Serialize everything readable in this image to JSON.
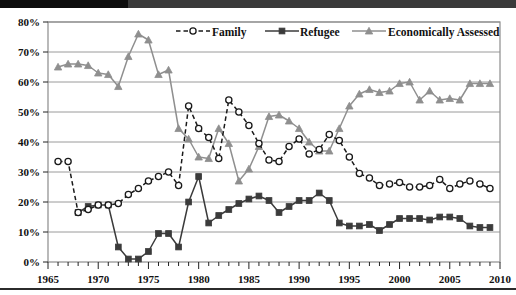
{
  "chart_data": {
    "type": "line",
    "title": "",
    "xlabel": "",
    "ylabel": "",
    "xlim": [
      1965,
      2010
    ],
    "ylim": [
      0,
      80
    ],
    "y_tick_labels": [
      "0%",
      "10%",
      "20%",
      "30%",
      "40%",
      "50%",
      "60%",
      "70%",
      "80%"
    ],
    "y_ticks": [
      0,
      10,
      20,
      30,
      40,
      50,
      60,
      70,
      80
    ],
    "x_tick_labels": [
      "1965",
      "1970",
      "1975",
      "1980",
      "1985",
      "1990",
      "1995",
      "2000",
      "2005",
      "2010"
    ],
    "x_ticks": [
      1965,
      1970,
      1975,
      1980,
      1985,
      1990,
      1995,
      2000,
      2005,
      2010
    ],
    "x_minor_tick_interval": 1,
    "grid": true,
    "grid_axis": "y",
    "legend_position": "top-center-inside",
    "series": [
      {
        "name": "Family",
        "marker": "open-circle",
        "line_style": "dashed",
        "color": "#1a1a1a",
        "x": [
          1966,
          1967,
          1968,
          1969,
          1970,
          1971,
          1972,
          1973,
          1974,
          1975,
          1976,
          1977,
          1978,
          1979,
          1980,
          1981,
          1982,
          1983,
          1984,
          1985,
          1986,
          1987,
          1988,
          1989,
          1990,
          1991,
          1992,
          1993,
          1994,
          1995,
          1996,
          1997,
          1998,
          1999,
          2000,
          2001,
          2002,
          2003,
          2004,
          2005,
          2006,
          2007,
          2008,
          2009
        ],
        "y": [
          33.5,
          33.5,
          16.5,
          17.5,
          19.0,
          19.0,
          19.5,
          22.5,
          24.5,
          27.0,
          28.5,
          30.0,
          25.5,
          52.0,
          44.5,
          41.5,
          34.5,
          54.0,
          50.0,
          45.5,
          39.5,
          34.0,
          33.5,
          38.5,
          41.0,
          36.0,
          37.5,
          42.5,
          40.5,
          35.0,
          29.5,
          28.0,
          25.5,
          26.0,
          26.5,
          25.0,
          25.0,
          25.5,
          27.5,
          24.5,
          26.0,
          27.0,
          26.0,
          24.5
        ]
      },
      {
        "name": "Refugee",
        "marker": "filled-square",
        "line_style": "solid",
        "color": "#3b3b3b",
        "x": [
          1968,
          1969,
          1970,
          1971,
          1972,
          1973,
          1974,
          1975,
          1976,
          1977,
          1978,
          1979,
          1980,
          1981,
          1982,
          1983,
          1984,
          1985,
          1986,
          1987,
          1988,
          1989,
          1990,
          1991,
          1992,
          1993,
          1994,
          1995,
          1996,
          1997,
          1998,
          1999,
          2000,
          2001,
          2002,
          2003,
          2004,
          2005,
          2006,
          2007,
          2008,
          2009
        ],
        "y": [
          16.5,
          18.5,
          19.0,
          19.0,
          5.0,
          1.0,
          1.0,
          3.5,
          9.5,
          9.5,
          5.0,
          20.0,
          28.5,
          13.0,
          15.5,
          17.5,
          19.5,
          21.0,
          22.0,
          20.5,
          16.5,
          18.5,
          20.5,
          20.5,
          23.0,
          20.5,
          13.0,
          12.0,
          12.0,
          12.5,
          10.5,
          12.5,
          14.5,
          14.5,
          14.5,
          14.0,
          15.0,
          15.0,
          14.5,
          12.0,
          11.5,
          11.5
        ]
      },
      {
        "name": "Economically Assessed",
        "marker": "filled-triangle",
        "line_style": "solid",
        "color": "#8f8f8f",
        "x": [
          1966,
          1967,
          1968,
          1969,
          1970,
          1971,
          1972,
          1973,
          1974,
          1975,
          1976,
          1977,
          1978,
          1979,
          1980,
          1981,
          1982,
          1983,
          1984,
          1985,
          1986,
          1987,
          1988,
          1989,
          1990,
          1991,
          1992,
          1993,
          1994,
          1995,
          1996,
          1997,
          1998,
          1999,
          2000,
          2001,
          2002,
          2003,
          2004,
          2005,
          2006,
          2007,
          2008,
          2009
        ],
        "y": [
          65.0,
          66.0,
          66.0,
          65.5,
          63.0,
          62.5,
          58.5,
          68.5,
          76.0,
          74.0,
          62.5,
          64.0,
          44.5,
          41.0,
          35.0,
          34.5,
          44.5,
          39.5,
          27.0,
          31.0,
          38.5,
          48.5,
          49.0,
          47.0,
          44.5,
          40.0,
          37.0,
          37.0,
          44.5,
          52.0,
          56.0,
          57.5,
          56.5,
          57.0,
          59.5,
          60.0,
          54.0,
          57.0,
          54.0,
          54.5,
          54.0,
          59.5,
          59.5,
          59.5
        ]
      }
    ]
  },
  "legend": {
    "items": [
      {
        "label": "Family"
      },
      {
        "label": "Refugee"
      },
      {
        "label": "Economically Assessed"
      }
    ]
  }
}
